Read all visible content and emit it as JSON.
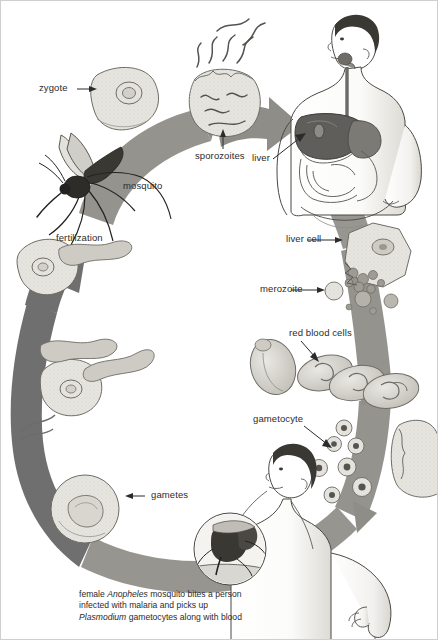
{
  "figure": {
    "palette": {
      "arrow_gray": "#8a8a8a",
      "arrow_dark_gray": "#6f6f6f",
      "ink": "#2b2b2b",
      "cell_fill": "#e3e2dd",
      "cell_stroke": "#6e6c66",
      "skin": "#ffffff",
      "organ_dark": "#6a6a68",
      "background": "#ffffff",
      "border": "#cfcfcf"
    }
  },
  "labels": {
    "zygote": "zygote",
    "sporozoites": "sporozoites",
    "liver": "liver",
    "mosquito": "mosquito",
    "liver_cell": "liver cell",
    "merozoite": "merozoite",
    "red_blood_cells": "red blood cells",
    "gametocyte": "gametocyte",
    "fertilization": "fertilization",
    "gametes": "gametes"
  },
  "caption": {
    "line1_a": "female ",
    "line1_i": "Anopheles",
    "line1_b": " mosquito bites a person infected with malaria and picks up ",
    "line2_i": "Plasmodium",
    "line2_b": " gametocytes along with blood"
  },
  "illustrations": {
    "mosquito": "mosquito-illustration",
    "human_upper": "human-torso-with-liver-illustration",
    "human_lower": "human-head-and-arm-illustration",
    "oocyst": "oocyst-releasing-sporozoites",
    "liver_cell": "infected-liver-cell-bursting",
    "merozoites": "merozoite-cells",
    "red_blood_cells": "red-blood-cells",
    "gametocytes": "gametocyte-cells",
    "zygote_cell": "zygote-cell",
    "ookinete_cells": "ookinete-cells",
    "gamete_cell": "gamete-cell",
    "bite_inset": "mosquito-bite-closeup-inset",
    "cycle_arrow": "circular-life-cycle-arrow"
  }
}
